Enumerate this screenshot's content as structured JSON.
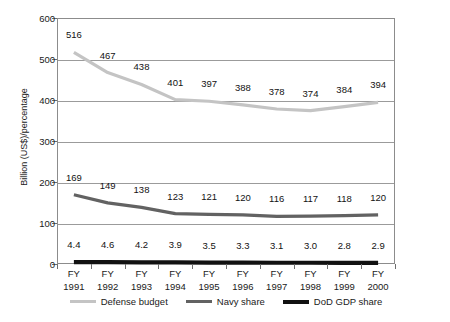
{
  "chart_data": {
    "type": "line",
    "title": "",
    "xlabel": "",
    "ylabel": "Billion (US$)/percentage",
    "ylim": [
      0,
      600
    ],
    "ytick_values": [
      0,
      100,
      200,
      300,
      400,
      500,
      600
    ],
    "ytick_labels": [
      "0",
      "100",
      "200",
      "300",
      "400",
      "500",
      "600"
    ],
    "grid": true,
    "legend_position": "bottom",
    "categories": [
      "FY 1991",
      "FY 1992",
      "FY 1993",
      "FY 1994",
      "FY 1995",
      "FY 1996",
      "FY 1997",
      "FY 1998",
      "FY 1999",
      "FY 2000"
    ],
    "category_lines": [
      {
        "top": "FY",
        "bottom": "1991"
      },
      {
        "top": "FY",
        "bottom": "1992"
      },
      {
        "top": "FY",
        "bottom": "1993"
      },
      {
        "top": "FY",
        "bottom": "1994"
      },
      {
        "top": "FY",
        "bottom": "1995"
      },
      {
        "top": "FY",
        "bottom": "1996"
      },
      {
        "top": "FY",
        "bottom": "1997"
      },
      {
        "top": "FY",
        "bottom": "1998"
      },
      {
        "top": "FY",
        "bottom": "1999"
      },
      {
        "top": "FY",
        "bottom": "2000"
      }
    ],
    "series": [
      {
        "name": "Defense budget",
        "color": "#c4c4c4",
        "width": 3.2,
        "values": [
          516,
          467,
          438,
          401,
          397,
          388,
          378,
          374,
          384,
          394
        ],
        "labels": [
          "516",
          "467",
          "438",
          "401",
          "397",
          "388",
          "378",
          "374",
          "384",
          "394"
        ]
      },
      {
        "name": "Navy share",
        "color": "#626262",
        "width": 3.2,
        "values": [
          169,
          149,
          138,
          123,
          121,
          120,
          116,
          117,
          118,
          120
        ],
        "labels": [
          "169",
          "149",
          "138",
          "123",
          "121",
          "120",
          "116",
          "117",
          "118",
          "120"
        ]
      },
      {
        "name": "DoD GDP share",
        "color": "#111111",
        "width": 4.2,
        "values": [
          4.4,
          4.6,
          4.2,
          3.9,
          3.5,
          3.3,
          3.1,
          3.0,
          2.8,
          2.9
        ],
        "labels": [
          "4.4",
          "4.6",
          "4.2",
          "3.9",
          "3.5",
          "3.3",
          "3.1",
          "3.0",
          "2.8",
          "2.9"
        ]
      }
    ]
  }
}
